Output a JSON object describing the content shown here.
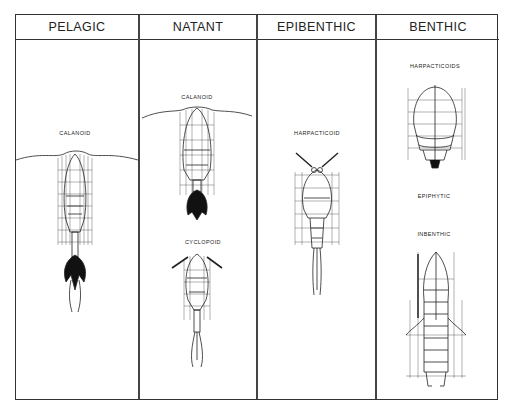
{
  "figure": {
    "columns": [
      {
        "header": "PELAGIC",
        "organisms": [
          {
            "label": "CALANOID"
          }
        ]
      },
      {
        "header": "NATANT",
        "organisms": [
          {
            "label": "CALANOID"
          },
          {
            "label": "CYCLOPOID"
          }
        ]
      },
      {
        "header": "EPIBENTHIC",
        "organisms": [
          {
            "label": "HARPACTICOID"
          }
        ]
      },
      {
        "header": "BENTHIC",
        "organisms": [
          {
            "label": "HARPACTICOIDS"
          },
          {
            "label": "EPIPHYTIC"
          },
          {
            "label": "INBENTHIC"
          }
        ]
      }
    ]
  }
}
